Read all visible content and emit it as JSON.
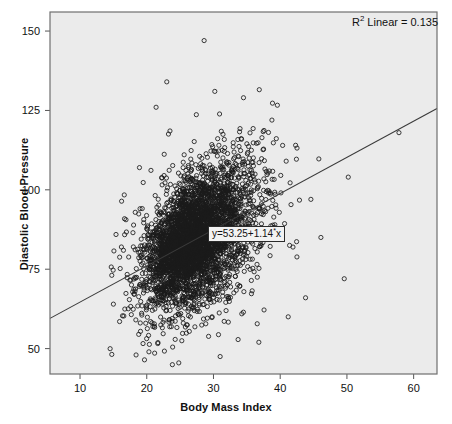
{
  "chart_data": {
    "type": "scatter",
    "title": "",
    "xlabel": "Body Mass Index",
    "ylabel": "Diastolic Blood Pressure",
    "xlim": [
      5.5,
      63.5
    ],
    "ylim": [
      42,
      156
    ],
    "xticks": [
      10,
      20,
      30,
      40,
      50,
      60
    ],
    "yticks": [
      50,
      75,
      100,
      125,
      150
    ],
    "grid": false,
    "legend_position": "none",
    "r2_label": "R",
    "r2_superscript": "2",
    "r2_text": " Linear = 0.135",
    "r2_value": 0.135,
    "equation_prefix": "y=53.25+1.14",
    "equation_operator": "*",
    "equation_suffix": "x",
    "fit": {
      "type": "linear",
      "intercept": 53.25,
      "slope": 1.14
    },
    "marker": {
      "shape": "open-circle",
      "radius": 2.1,
      "color": "#1a1a1a",
      "fill": "none",
      "stroke_width": 0.85
    },
    "line_color": "#3a3a3a",
    "plot_background": "#ebebeb",
    "frame_color": "#6f6f6f",
    "n_points": 2600,
    "cluster": {
      "x_mean": 26.2,
      "x_sd": 4.4,
      "x_skew": 0.55,
      "resid_sd": 11.2,
      "x_min": 14.0,
      "x_max": 62.0,
      "y_min": 44.0,
      "y_max": 152.0
    },
    "notable_points": [
      {
        "x": 28.6,
        "y": 147.0
      },
      {
        "x": 23.0,
        "y": 134.0
      },
      {
        "x": 30.2,
        "y": 131.0
      },
      {
        "x": 34.5,
        "y": 129.0
      },
      {
        "x": 21.4,
        "y": 126.0
      },
      {
        "x": 57.8,
        "y": 118.0
      },
      {
        "x": 50.2,
        "y": 104.0
      },
      {
        "x": 44.6,
        "y": 97.0
      },
      {
        "x": 49.6,
        "y": 72.0
      },
      {
        "x": 46.1,
        "y": 85.0
      },
      {
        "x": 16.2,
        "y": 82.0
      },
      {
        "x": 15.0,
        "y": 64.0
      },
      {
        "x": 18.4,
        "y": 48.0
      },
      {
        "x": 24.8,
        "y": 45.5
      },
      {
        "x": 31.0,
        "y": 47.5
      },
      {
        "x": 36.8,
        "y": 52.0
      },
      {
        "x": 41.2,
        "y": 60.0
      },
      {
        "x": 43.8,
        "y": 66.0
      }
    ]
  }
}
